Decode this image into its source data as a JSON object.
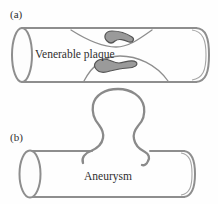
{
  "figure": {
    "panel_a": {
      "label": "(a)",
      "annotation": "Venerable plaque",
      "description": "cylindrical vessel narrowed by two plaque deposits"
    },
    "panel_b": {
      "label": "(b)",
      "annotation": "Aneurysm",
      "description": "cylindrical vessel with balloon-like bulge on top wall"
    }
  },
  "colors": {
    "background": "#fefefe",
    "vessel_outline": "#8e8e8e",
    "cap_rim": "#a6a6a6",
    "balloon_outline": "#8a8a8a",
    "plaque_fill": "#9a9a9a",
    "plaque_outline": "#555555",
    "text": "#2f2f2f"
  }
}
